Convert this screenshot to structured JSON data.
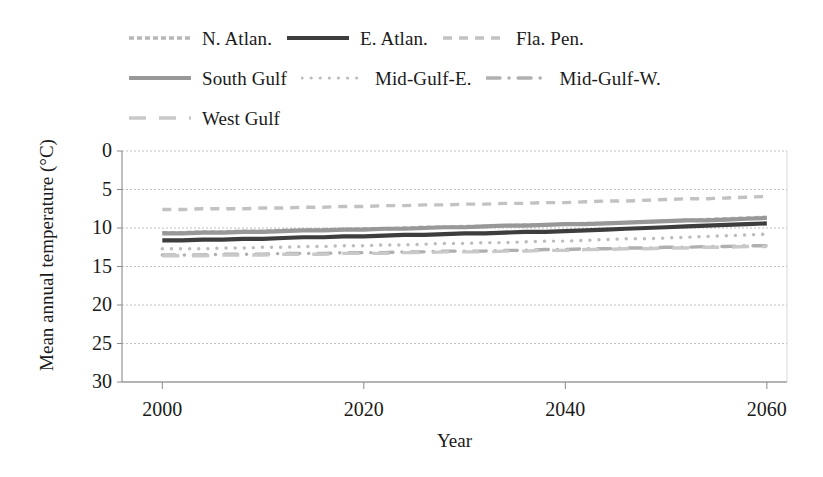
{
  "legend": {
    "rows": [
      [
        {
          "label": "N. Atlan.",
          "key": "n_atlan",
          "color": "#b8b8b8",
          "style": "fine-dash",
          "width": 3.4
        },
        {
          "label": "E. Atlan.",
          "key": "e_atlan",
          "color": "#3d3d3d",
          "style": "solid",
          "width": 4.2
        },
        {
          "label": "Fla. Pen.",
          "key": "fla_pen",
          "color": "#c2c2c2",
          "style": "dash",
          "width": 3.6
        }
      ],
      [
        {
          "label": "South Gulf",
          "key": "south_gulf",
          "color": "#989898",
          "style": "solid",
          "width": 4.0
        },
        {
          "label": "Mid-Gulf-E.",
          "key": "mid_gulf_e",
          "color": "#bdbdbd",
          "style": "dot",
          "width": 3.2
        },
        {
          "label": "Mid-Gulf-W.",
          "key": "mid_gulf_w",
          "color": "#b0b0b0",
          "style": "dash-dot",
          "width": 3.4
        }
      ],
      [
        {
          "label": "West Gulf",
          "key": "west_gulf",
          "color": "#c9c9c9",
          "style": "long-dash",
          "width": 3.4
        }
      ]
    ]
  },
  "axis": {
    "ylabel": "Mean annual temperature (°C)",
    "xlabel": "Year",
    "yticks": [
      "30",
      "25",
      "20",
      "15",
      "10",
      "5",
      "0"
    ],
    "xticks": [
      "2000",
      "2020",
      "2040",
      "2060"
    ]
  },
  "chart_data": {
    "type": "line",
    "title": "",
    "xlabel": "Year",
    "ylabel": "Mean annual temperature (°C)",
    "xlim": [
      1996,
      2062
    ],
    "ylim": [
      0,
      30
    ],
    "ytick_values": [
      0,
      5,
      10,
      15,
      20,
      25,
      30
    ],
    "xtick_values": [
      2000,
      2020,
      2040,
      2060
    ],
    "grid": "horizontal",
    "legend_position": "above-plot",
    "x": [
      2000,
      2002,
      2004,
      2006,
      2008,
      2010,
      2012,
      2014,
      2016,
      2018,
      2020,
      2022,
      2024,
      2026,
      2028,
      2030,
      2032,
      2034,
      2036,
      2038,
      2040,
      2042,
      2044,
      2046,
      2048,
      2050,
      2052,
      2054,
      2056,
      2058,
      2060
    ],
    "series": [
      {
        "name": "N. Atlan.",
        "key": "n_atlan",
        "color": "#b8b8b8",
        "style": "fine-dash",
        "values": [
          19.4,
          19.4,
          19.5,
          19.5,
          19.6,
          19.6,
          19.7,
          19.7,
          19.8,
          19.8,
          19.9,
          19.9,
          20.0,
          20.1,
          20.1,
          20.2,
          20.2,
          20.3,
          20.4,
          20.4,
          20.5,
          20.6,
          20.6,
          20.7,
          20.8,
          20.9,
          21.0,
          21.1,
          21.2,
          21.3,
          21.4
        ]
      },
      {
        "name": "E. Atlan.",
        "key": "e_atlan",
        "color": "#3d3d3d",
        "style": "solid",
        "values": [
          18.4,
          18.4,
          18.5,
          18.5,
          18.6,
          18.6,
          18.7,
          18.8,
          18.8,
          18.9,
          18.9,
          19.0,
          19.1,
          19.1,
          19.2,
          19.3,
          19.3,
          19.4,
          19.5,
          19.5,
          19.6,
          19.7,
          19.8,
          19.9,
          20.0,
          20.1,
          20.2,
          20.3,
          20.4,
          20.5,
          20.6
        ]
      },
      {
        "name": "Fla. Pen.",
        "key": "fla_pen",
        "color": "#c2c2c2",
        "style": "dash",
        "values": [
          22.4,
          22.4,
          22.5,
          22.5,
          22.5,
          22.6,
          22.6,
          22.7,
          22.7,
          22.8,
          22.8,
          22.9,
          22.9,
          23.0,
          23.0,
          23.1,
          23.1,
          23.2,
          23.2,
          23.3,
          23.3,
          23.4,
          23.5,
          23.5,
          23.6,
          23.7,
          23.8,
          23.8,
          23.9,
          24.0,
          24.1
        ]
      },
      {
        "name": "South Gulf",
        "key": "south_gulf",
        "color": "#989898",
        "style": "solid",
        "values": [
          19.3,
          19.3,
          19.4,
          19.4,
          19.5,
          19.5,
          19.6,
          19.7,
          19.7,
          19.8,
          19.8,
          19.9,
          19.9,
          20.0,
          20.1,
          20.1,
          20.2,
          20.3,
          20.3,
          20.4,
          20.5,
          20.5,
          20.6,
          20.7,
          20.8,
          20.9,
          21.0,
          21.0,
          21.1,
          21.2,
          21.3
        ]
      },
      {
        "name": "Mid-Gulf-E.",
        "key": "mid_gulf_e",
        "color": "#bdbdbd",
        "style": "dot",
        "values": [
          17.3,
          17.3,
          17.3,
          17.4,
          17.4,
          17.5,
          17.5,
          17.6,
          17.6,
          17.7,
          17.7,
          17.8,
          17.8,
          17.9,
          18.0,
          18.0,
          18.1,
          18.1,
          18.2,
          18.3,
          18.3,
          18.4,
          18.5,
          18.6,
          18.6,
          18.7,
          18.8,
          18.9,
          19.0,
          19.1,
          19.2
        ]
      },
      {
        "name": "Mid-Gulf-W.",
        "key": "mid_gulf_w",
        "color": "#b0b0b0",
        "style": "dash-dot",
        "values": [
          16.5,
          16.5,
          16.5,
          16.6,
          16.6,
          16.6,
          16.7,
          16.7,
          16.7,
          16.8,
          16.8,
          16.8,
          16.9,
          16.9,
          17.0,
          17.0,
          17.0,
          17.1,
          17.1,
          17.2,
          17.2,
          17.3,
          17.3,
          17.4,
          17.4,
          17.5,
          17.5,
          17.6,
          17.6,
          17.7,
          17.7
        ]
      },
      {
        "name": "West Gulf",
        "key": "west_gulf",
        "color": "#c9c9c9",
        "style": "long-dash",
        "values": [
          16.4,
          16.4,
          16.4,
          16.5,
          16.5,
          16.5,
          16.6,
          16.6,
          16.6,
          16.7,
          16.7,
          16.7,
          16.8,
          16.8,
          16.9,
          16.9,
          16.9,
          17.0,
          17.0,
          17.1,
          17.1,
          17.2,
          17.2,
          17.3,
          17.3,
          17.4,
          17.4,
          17.5,
          17.5,
          17.6,
          17.6
        ]
      }
    ]
  }
}
